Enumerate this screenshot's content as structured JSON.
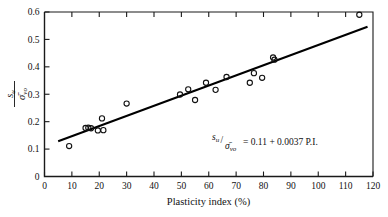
{
  "chart_data": {
    "type": "scatter",
    "title": "",
    "subtitle": "",
    "xlabel": "Plasticity index (%)",
    "ylabel": "su/σ̄vo",
    "ylabel_parts": {
      "num": "s",
      "num_sub": "u",
      "den": "σ̄",
      "den_sub": "vo"
    },
    "xlim": [
      0,
      120
    ],
    "ylim": [
      0,
      0.6
    ],
    "xticks": [
      0,
      10,
      20,
      30,
      40,
      50,
      60,
      70,
      80,
      90,
      100,
      110,
      120
    ],
    "yticks": [
      0,
      0.1,
      0.2,
      0.3,
      0.4,
      0.5,
      0.6
    ],
    "xtick_labels": [
      "0",
      "10",
      "20",
      "30",
      "40",
      "50",
      "60",
      "70",
      "80",
      "90",
      "100",
      "110",
      "120"
    ],
    "ytick_labels": [
      "0",
      "0.1",
      "0.2",
      "0.3",
      "0.4",
      "0.5",
      "0.6"
    ],
    "grid": false,
    "legend": null,
    "marker": "open-circle",
    "points": [
      {
        "x": 9,
        "y": 0.111
      },
      {
        "x": 15,
        "y": 0.177
      },
      {
        "x": 16,
        "y": 0.178
      },
      {
        "x": 17,
        "y": 0.176
      },
      {
        "x": 19.5,
        "y": 0.168
      },
      {
        "x": 21,
        "y": 0.212
      },
      {
        "x": 21.5,
        "y": 0.169
      },
      {
        "x": 30,
        "y": 0.266
      },
      {
        "x": 49.5,
        "y": 0.299
      },
      {
        "x": 52.5,
        "y": 0.318
      },
      {
        "x": 55,
        "y": 0.279
      },
      {
        "x": 59,
        "y": 0.342
      },
      {
        "x": 62.5,
        "y": 0.316
      },
      {
        "x": 66.5,
        "y": 0.363
      },
      {
        "x": 75,
        "y": 0.342
      },
      {
        "x": 76.5,
        "y": 0.377
      },
      {
        "x": 79.5,
        "y": 0.36
      },
      {
        "x": 83.5,
        "y": 0.434
      },
      {
        "x": 84,
        "y": 0.426
      },
      {
        "x": 115,
        "y": 0.59
      }
    ],
    "fit_line": {
      "equation_text": "su/σ̄vo = 0.11 + 0.0037 P.I.",
      "intercept": 0.11,
      "slope": 0.0037,
      "x_start": 5,
      "x_end": 118
    },
    "annotations": [
      {
        "id": "fit-equation",
        "lhs_num": "s",
        "lhs_num_sub": "u",
        "lhs_den": "σ̄",
        "lhs_den_sub": "vo",
        "rhs": " = 0.11 + 0.0037 P.I.",
        "x": 47,
        "y": 0.158
      }
    ]
  }
}
